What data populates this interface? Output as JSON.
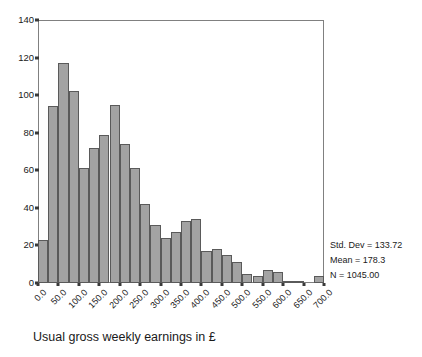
{
  "chart_data": {
    "type": "bar",
    "title": "",
    "xlabel": "Usual gross weekly earnings in £",
    "ylabel": "",
    "xlim": [
      0,
      700
    ],
    "ylim": [
      0,
      140
    ],
    "bin_width": 25,
    "grid": false,
    "legend": null,
    "xticks": [
      "0.0",
      "50.0",
      "100.0",
      "150.0",
      "200.0",
      "250.0",
      "300.0",
      "350.0",
      "400.0",
      "450.0",
      "500.0",
      "550.0",
      "600.0",
      "650.0",
      "700.0"
    ],
    "xtick_values": [
      0,
      50,
      100,
      150,
      200,
      250,
      300,
      350,
      400,
      450,
      500,
      550,
      600,
      650,
      700
    ],
    "yticks": [
      "0",
      "20",
      "40",
      "60",
      "80",
      "100",
      "120",
      "140"
    ],
    "ytick_values": [
      0,
      20,
      40,
      60,
      80,
      100,
      120,
      140
    ],
    "bin_starts": [
      0,
      25,
      50,
      75,
      100,
      125,
      150,
      175,
      200,
      225,
      250,
      275,
      300,
      325,
      350,
      375,
      400,
      425,
      450,
      475,
      500,
      525,
      550,
      575,
      600,
      625,
      650,
      675
    ],
    "values": [
      23,
      94,
      117,
      102,
      61,
      72,
      79,
      95,
      74,
      61,
      42,
      31,
      24,
      27,
      33,
      34,
      17,
      18,
      15,
      11,
      5,
      4,
      7,
      6,
      1,
      1,
      0,
      4
    ],
    "bar_color": "#a3a3a3",
    "bar_edge_color": "#5a5a5a",
    "frame_color": "#808080"
  },
  "stats": {
    "std_dev": "Std. Dev = 133.72",
    "mean": "Mean = 178.3",
    "n": "N = 1045.00"
  },
  "caption": {
    "text": "Usual gross weekly earnings in £"
  }
}
